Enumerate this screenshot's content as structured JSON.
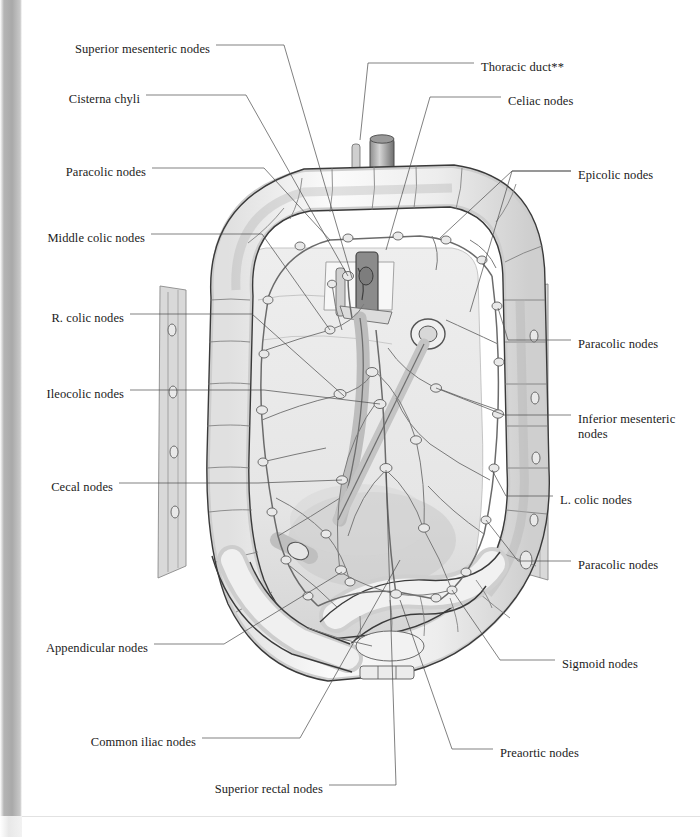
{
  "figure": {
    "type": "anatomical-illustration",
    "style": "grayscale pencil / wash medical illustration"
  },
  "labels_left": [
    {
      "id": "superior-mesenteric-nodes",
      "text": "Superior mesenteric nodes",
      "x": 210,
      "y": 49
    },
    {
      "id": "cisterna-chyli",
      "text": "Cisterna chyli",
      "x": 140,
      "y": 99
    },
    {
      "id": "paracolic-nodes-upper-left",
      "text": "Paracolic nodes",
      "x": 146,
      "y": 172
    },
    {
      "id": "middle-colic-nodes",
      "text": "Middle colic nodes",
      "x": 145,
      "y": 238
    },
    {
      "id": "r-colic-nodes",
      "text": "R. colic nodes",
      "x": 124,
      "y": 318
    },
    {
      "id": "ileocolic-nodes",
      "text": "Ileocolic nodes",
      "x": 124,
      "y": 394
    },
    {
      "id": "cecal-nodes",
      "text": "Cecal nodes",
      "x": 113,
      "y": 487
    },
    {
      "id": "appendicular-nodes",
      "text": "Appendicular nodes",
      "x": 148,
      "y": 648
    },
    {
      "id": "common-iliac-nodes",
      "text": "Common iliac nodes",
      "x": 196,
      "y": 742
    },
    {
      "id": "superior-rectal-nodes",
      "text": "Superior rectal nodes",
      "x": 323,
      "y": 789
    }
  ],
  "labels_right": [
    {
      "id": "thoracic-duct",
      "text": "Thoracic duct**",
      "x": 481,
      "y": 67
    },
    {
      "id": "celiac-nodes",
      "text": "Celiac nodes",
      "x": 508,
      "y": 101
    },
    {
      "id": "epicolic-nodes",
      "text": "Epicolic nodes",
      "x": 578,
      "y": 175
    },
    {
      "id": "paracolic-nodes-mid-right",
      "text": "Paracolic nodes",
      "x": 578,
      "y": 344
    },
    {
      "id": "inferior-mesenteric-nodes",
      "text": "Inferior mesenteric nodes",
      "x": 578,
      "y": 419
    },
    {
      "id": "l-colic-nodes",
      "text": "L. colic nodes",
      "x": 560,
      "y": 500
    },
    {
      "id": "paracolic-nodes-lower-right",
      "text": "Paracolic nodes",
      "x": 578,
      "y": 565
    },
    {
      "id": "sigmoid-nodes",
      "text": "Sigmoid nodes",
      "x": 562,
      "y": 664
    },
    {
      "id": "preaortic-nodes",
      "text": "Preaortic nodes",
      "x": 500,
      "y": 753
    }
  ],
  "colors": {
    "page_background": "#ffffff",
    "text": "#1b1b1b",
    "leader_line": "#4a4a4a",
    "gutter_gray": "#a9a9a9",
    "art_outline": "#3a3a3a",
    "lymph_vessel": "#6b6b6b",
    "node_fill": "#e9e9e9",
    "mesentery_fill": "#ececec",
    "colon_fill": "#f4f4f4"
  },
  "footnote_marker": "**"
}
